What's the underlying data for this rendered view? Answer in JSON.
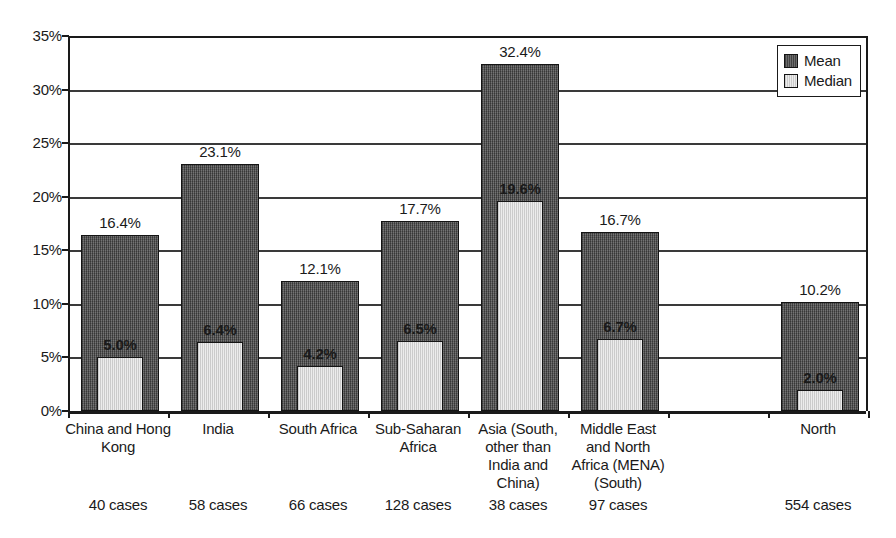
{
  "chart_data": {
    "type": "bar",
    "title": "",
    "xlabel": "",
    "ylabel": "",
    "ylim": [
      0,
      35
    ],
    "ytick_labels": [
      "0%",
      "5%",
      "10%",
      "15%",
      "20%",
      "25%",
      "30%",
      "35%"
    ],
    "ytick_values": [
      0,
      5,
      10,
      15,
      20,
      25,
      30,
      35
    ],
    "grid": true,
    "legend_position": "top-right",
    "categories": [
      "China and Hong Kong",
      "India",
      "South Africa",
      "Sub-Saharan Africa",
      "Asia (South, other than India and China)",
      "Middle East and North Africa (MENA) (South)",
      "",
      "North"
    ],
    "category_lines": [
      [
        "China and Hong",
        "Kong"
      ],
      [
        "India"
      ],
      [
        "South Africa"
      ],
      [
        "Sub-Saharan",
        "Africa"
      ],
      [
        "Asia (South,",
        "other than",
        "India and",
        "China)"
      ],
      [
        "Middle East",
        "and North",
        "Africa (MENA)",
        "(South)"
      ],
      [],
      [
        "North"
      ]
    ],
    "case_counts": [
      "40 cases",
      "58 cases",
      "66 cases",
      "128 cases",
      "38 cases",
      "97 cases",
      "",
      "554 cases"
    ],
    "series": [
      {
        "name": "Mean",
        "color": "#5c5c5c",
        "values": [
          16.4,
          23.1,
          12.1,
          17.7,
          32.4,
          16.7,
          null,
          10.2
        ],
        "labels": [
          "16.4%",
          "23.1%",
          "12.1%",
          "17.7%",
          "32.4%",
          "16.7%",
          "",
          "10.2%"
        ]
      },
      {
        "name": "Median",
        "color": "#e2e2e2",
        "values": [
          5.0,
          6.4,
          4.2,
          6.5,
          19.6,
          6.7,
          null,
          2.0
        ],
        "labels": [
          "5.0%",
          "6.4%",
          "4.2%",
          "6.5%",
          "19.6%",
          "6.7%",
          "",
          "2.0%"
        ]
      }
    ]
  },
  "legend": {
    "items": [
      {
        "label": "Mean",
        "swatch": "mean"
      },
      {
        "label": "Median",
        "swatch": "median"
      }
    ]
  }
}
